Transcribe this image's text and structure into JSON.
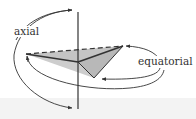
{
  "diagram": {
    "labels": {
      "axial": "axial",
      "equatorial": "equatorial"
    },
    "colors": {
      "stroke": "#333333",
      "triangle_fill": "#bdbdbd",
      "background": "#ffffff",
      "bottom_band": "#f3f3f3"
    },
    "elements": [
      "vertical-axis",
      "triangular-plane",
      "axial-rotation-arrow",
      "equatorial-rotation-arrow"
    ]
  }
}
